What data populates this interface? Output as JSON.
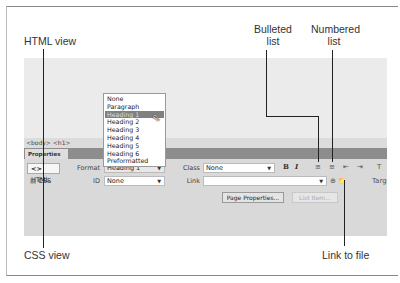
{
  "callouts": {
    "html_view": "HTML view",
    "bulleted_list": [
      "Bulleted",
      "list"
    ],
    "numbered_list": [
      "Numbered",
      "list"
    ],
    "css_view": "CSS view",
    "link_to_file": "Link to file"
  },
  "tag_selector": "<body> <h1>",
  "panel": {
    "tab_label": "Properties",
    "modes": {
      "html": "HTML",
      "css": "CSS",
      "html_icon": "code-brackets-icon",
      "css_icon": "css-icon"
    },
    "format_label": "Format",
    "format_value": "Heading 1",
    "id_label": "ID",
    "id_value": "None",
    "class_label": "Class",
    "class_value": "None",
    "link_label": "Link",
    "link_value": "",
    "bold": "B",
    "italic": "I",
    "target_label": "Targ",
    "title_label": "T",
    "page_properties_button": "Page Properties...",
    "list_item_button": "List Item..."
  },
  "format_dropdown": {
    "options": [
      "None",
      "Paragraph",
      "Heading 1",
      "Heading 2",
      "Heading 3",
      "Heading 4",
      "Heading 5",
      "Heading 6",
      "Preformatted"
    ],
    "highlighted_index": 2
  }
}
